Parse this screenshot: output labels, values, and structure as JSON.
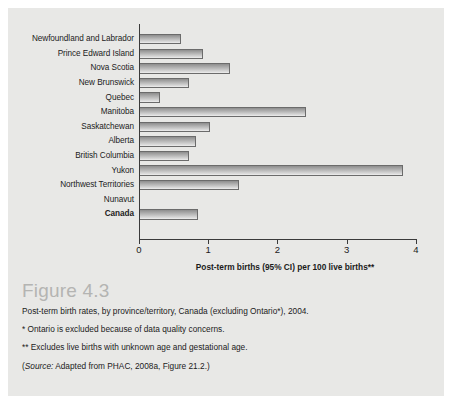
{
  "chart_data": {
    "type": "bar",
    "orientation": "horizontal",
    "title": "",
    "xlabel": "Post-term births (95% CI) per 100 live births**",
    "ylabel": "",
    "xlim": [
      0,
      4
    ],
    "xticks": [
      0,
      1,
      2,
      3,
      4
    ],
    "xtick_labels": [
      "0",
      "1",
      "2",
      "3",
      "4"
    ],
    "grid": false,
    "legend": false,
    "categories": [
      "Newfoundland and Labrador",
      "Prince Edward Island",
      "Nova Scotia",
      "New Brunswick",
      "Quebec",
      "Manitoba",
      "Saskatchewan",
      "Alberta",
      "British Columbia",
      "Yukon",
      "Northwest Territories",
      "Nunavut",
      "Canada"
    ],
    "values": [
      0.61,
      0.93,
      1.32,
      0.72,
      0.31,
      2.41,
      1.03,
      0.83,
      0.72,
      3.81,
      1.45,
      0.0,
      0.85
    ],
    "emphasized_category": "Canada"
  },
  "caption": {
    "figure_number": "Figure 4.3",
    "description": "Post-term birth rates, by province/territory, Canada (excluding Ontario*), 2004.",
    "footnote_1": "* Ontario is excluded because of data quality concerns.",
    "footnote_2": "** Excludes live births with unknown age and gestational age.",
    "source_prefix": "(",
    "source_label": "Source:",
    "source_text": " Adapted from PHAC, 2008a, Figure 21.2.)"
  },
  "colors": {
    "panel_background": "#e8e8e6",
    "page_background": "#ffffff",
    "bar_fill_dark": "#8d8d8d",
    "bar_fill_light": "#efefef",
    "bar_border": "#6b6b6b",
    "axis": "#3a3a3a",
    "text": "#1b1b1b",
    "figure_number": "#b4b4b2"
  }
}
